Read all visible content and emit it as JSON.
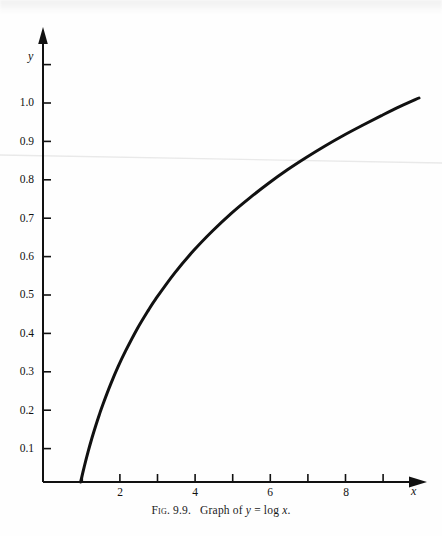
{
  "figure": {
    "caption_prefix": "Fig.",
    "caption_number": "9.9.",
    "caption_text": "Graph of",
    "caption_var_y": "y",
    "caption_equals": "=",
    "caption_func": "log",
    "caption_var_x": "x",
    "caption_period": ".",
    "caption_full": "Fig. 9.9.  Graph of y = log x."
  },
  "chart_data": {
    "type": "line",
    "xlabel": "x",
    "ylabel": "y",
    "xlim": [
      0,
      10.4
    ],
    "ylim": [
      0,
      1.12
    ],
    "grid": false,
    "legend": "none",
    "curve_color": "#111111",
    "axis_color": "#111111",
    "x_tick_values": [
      1,
      2,
      3,
      4,
      5,
      6,
      7,
      8,
      9,
      10
    ],
    "x_tick_labels": [
      "",
      "2",
      "",
      "4",
      "",
      "6",
      "",
      "8",
      "",
      ""
    ],
    "y_tick_values": [
      0.1,
      0.2,
      0.3,
      0.4,
      0.5,
      0.6,
      0.7,
      0.8,
      0.9,
      1.0,
      1.1
    ],
    "y_tick_labels": [
      "0.1",
      "0.2",
      "0.3",
      "0.4",
      "0.5",
      "0.6",
      "0.7",
      "0.8",
      "0.9",
      "1.0",
      ""
    ],
    "x": [
      1.0,
      1.1,
      1.2,
      1.3,
      1.4,
      1.5,
      1.6,
      1.8,
      2.0,
      2.2,
      2.5,
      2.8,
      3.0,
      3.5,
      4.0,
      4.5,
      5.0,
      5.5,
      6.0,
      6.5,
      7.0,
      7.5,
      8.0,
      8.5,
      9.0,
      9.5,
      10.0
    ],
    "values": [
      0.0,
      0.041,
      0.079,
      0.114,
      0.146,
      0.176,
      0.204,
      0.255,
      0.301,
      0.342,
      0.398,
      0.447,
      0.477,
      0.544,
      0.602,
      0.653,
      0.699,
      0.74,
      0.778,
      0.813,
      0.845,
      0.875,
      0.903,
      0.929,
      0.954,
      0.978,
      1.0
    ]
  }
}
